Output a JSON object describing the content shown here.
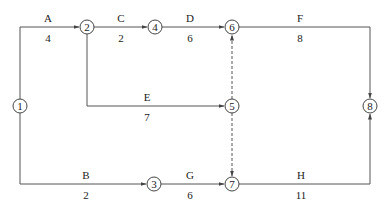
{
  "diagram": {
    "type": "activity-on-arrow network",
    "nodes": [
      {
        "id": "1",
        "x": 20,
        "y": 106
      },
      {
        "id": "2",
        "x": 87,
        "y": 27
      },
      {
        "id": "3",
        "x": 154,
        "y": 184
      },
      {
        "id": "4",
        "x": 155,
        "y": 27
      },
      {
        "id": "5",
        "x": 232,
        "y": 106
      },
      {
        "id": "6",
        "x": 232,
        "y": 27
      },
      {
        "id": "7",
        "x": 232,
        "y": 184
      },
      {
        "id": "8",
        "x": 370,
        "y": 106
      }
    ],
    "activities": [
      {
        "name": "A",
        "duration": "4",
        "from": "1",
        "to": "2"
      },
      {
        "name": "B",
        "duration": "2",
        "from": "1",
        "to": "3"
      },
      {
        "name": "C",
        "duration": "2",
        "from": "2",
        "to": "4"
      },
      {
        "name": "D",
        "duration": "6",
        "from": "4",
        "to": "6"
      },
      {
        "name": "E",
        "duration": "7",
        "from": "2",
        "to": "5"
      },
      {
        "name": "F",
        "duration": "8",
        "from": "6",
        "to": "8"
      },
      {
        "name": "G",
        "duration": "6",
        "from": "3",
        "to": "7"
      },
      {
        "name": "H",
        "duration": "11",
        "from": "7",
        "to": "8"
      }
    ],
    "dummies": [
      {
        "from": "5",
        "to": "6"
      },
      {
        "from": "5",
        "to": "7"
      }
    ]
  }
}
